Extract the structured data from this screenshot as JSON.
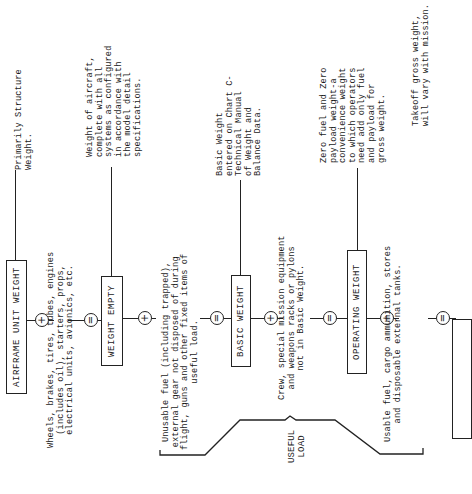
{
  "diagram": {
    "orientation": "rotated-90-ccw",
    "boxes": [
      {
        "id": "airframe-unit-weight",
        "label": "AIRFRAME UNIT WEIGHT"
      },
      {
        "id": "weight-empty",
        "label": "WEIGHT EMPTY"
      },
      {
        "id": "basic-weight",
        "label": "BASIC WEIGHT"
      },
      {
        "id": "operating-weight",
        "label": "OPERATING WEIGHT"
      },
      {
        "id": "gross-weight",
        "label": ""
      }
    ],
    "operators": {
      "plus": "+",
      "equals": "="
    },
    "additions": [
      {
        "id": "equipment",
        "text": "Wheels, brakes, tires, tubes, engines\n(includes oil), starters, props,\nelectrical units, avionics, etc."
      },
      {
        "id": "unusable-fuel",
        "text": "Unusable fuel (including trapped),\nexternal gear not disposed of during\nflight, guns and other fixed items of\nuseful load."
      },
      {
        "id": "crew",
        "text": "Crew, special mission equipment\nand weapons racks or pylons\nnot in Basic Weight."
      },
      {
        "id": "usable-fuel",
        "text": "Usable fuel, cargo ammunition, stores\nand disposable external tanks."
      }
    ],
    "notes": [
      {
        "id": "airframe-note",
        "text": "Primarily Structure\nWeight."
      },
      {
        "id": "weight-empty-note",
        "text": "Weight of aircraft,\ncomplete with all\nsystems as configured\nin accordance with\nthe model detail\nspecifications."
      },
      {
        "id": "basic-weight-note",
        "text": "Basic Weight\nentered on Chart C-\nTechnical Manual\nof Weight and\nBalance Data."
      },
      {
        "id": "operating-weight-note",
        "text": "Zero fuel and Zero\npayload weight-a\nconvenience weight\nto which operators\nneed add only fuel\nand payload for\ngross weight."
      },
      {
        "id": "gross-weight-note",
        "text": "Takeoff gross weight,\nwill vary with mission."
      }
    ],
    "brace_label": "USEFUL\nLOAD"
  }
}
